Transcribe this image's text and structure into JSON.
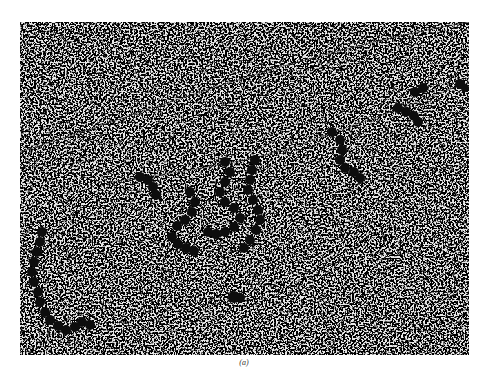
{
  "figure": {
    "caption": "(a)",
    "background_color": "#e6e6e6",
    "speckle_color": "#2a2a2a",
    "fiber_color": "#111111"
  }
}
